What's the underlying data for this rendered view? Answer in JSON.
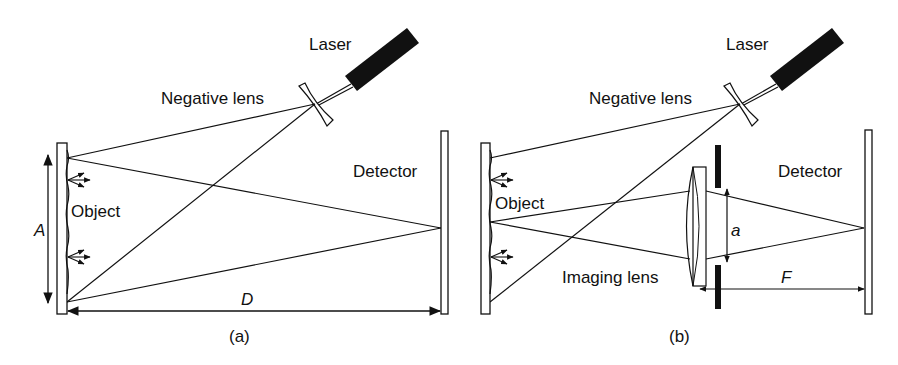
{
  "panels": [
    {
      "id": "a",
      "caption": "(a)",
      "labels": {
        "laser": "Laser",
        "negative_lens": "Negative lens",
        "object": "Object",
        "detector": "Detector",
        "aperture_width": "A",
        "distance": "D"
      }
    },
    {
      "id": "b",
      "caption": "(b)",
      "labels": {
        "laser": "Laser",
        "negative_lens": "Negative lens",
        "object": "Object",
        "detector": "Detector",
        "imaging_lens": "Imaging lens",
        "aperture": "a",
        "focal_length": "F"
      }
    }
  ],
  "colors": {
    "line": "#111111",
    "background": "#ffffff"
  }
}
